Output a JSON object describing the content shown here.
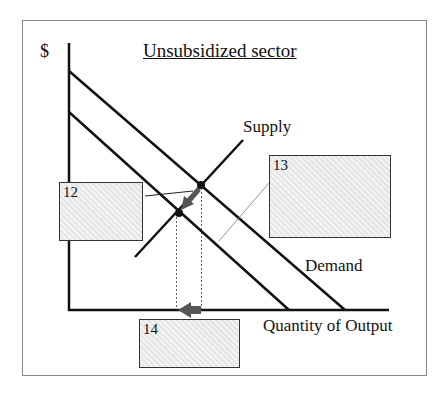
{
  "diagram": {
    "title": "Unsubsidized sector",
    "y_axis_label": "$",
    "x_axis_label": "Quantity of Output",
    "curves": {
      "supply_label": "Supply",
      "demand_label": "Demand"
    },
    "answer_boxes": [
      {
        "id": "12",
        "label": "12"
      },
      {
        "id": "13",
        "label": "13"
      },
      {
        "id": "14",
        "label": "14"
      }
    ],
    "colors": {
      "line": "#111111",
      "box_fill": "#ececec",
      "arrow": "#555555"
    }
  }
}
